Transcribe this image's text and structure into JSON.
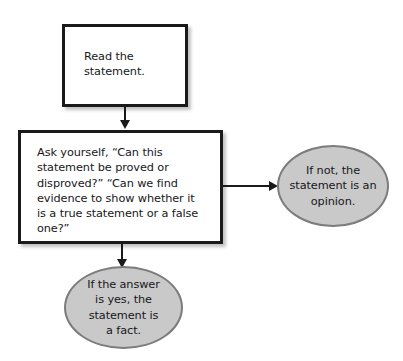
{
  "diagram": {
    "background_color": "#ffffff",
    "box_border_color": "#1a1a1a",
    "ellipse_fill_color": "#c9c9c9",
    "ellipse_border_color": "#7c7c7c",
    "text_color": "#17171a",
    "connector_color": "#1a1a1a"
  },
  "nodes": {
    "read_statement": {
      "shape": "rectangle",
      "text": "Read the\nstatement."
    },
    "ask_yourself": {
      "shape": "rectangle",
      "text": "Ask yourself, “Can this\nstatement be proved or\ndisproved?” “Can we find\nevidence to show whether it\nis a true statement or a false\none?”"
    },
    "opinion_result": {
      "shape": "ellipse",
      "text": "If not, the\nstatement is an\nopinion."
    },
    "fact_result": {
      "shape": "ellipse",
      "text": "If the answer\nis yes, the\nstatement is\na fact."
    }
  },
  "connectors": [
    {
      "id": "read-to-ask",
      "from": "read_statement",
      "to": "ask_yourself",
      "direction": "down"
    },
    {
      "id": "ask-to-opinion",
      "from": "ask_yourself",
      "to": "opinion_result",
      "direction": "right"
    },
    {
      "id": "ask-to-fact",
      "from": "ask_yourself",
      "to": "fact_result",
      "direction": "down"
    }
  ]
}
